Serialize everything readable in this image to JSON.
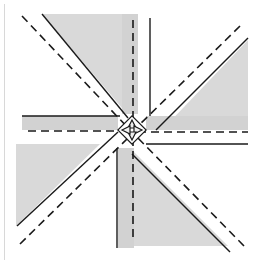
{
  "diagram": {
    "title": "",
    "colors": {
      "background": "#ffffff",
      "shade": "#d9d9d9",
      "shade_dark": "#c4c4c4",
      "line": "#1a1a1a",
      "frame": "#d0d0d0"
    },
    "elements": [
      {
        "id": "flap-top",
        "type": "shaded-triangle"
      },
      {
        "id": "flap-right",
        "type": "shaded-triangle"
      },
      {
        "id": "flap-bottom",
        "type": "shaded-triangle"
      },
      {
        "id": "flap-left",
        "type": "shaded-triangle"
      },
      {
        "id": "dashed-diagonal-nw",
        "type": "valley-fold-line"
      },
      {
        "id": "dashed-diagonal-ne",
        "type": "valley-fold-line"
      },
      {
        "id": "dashed-diagonal-sw",
        "type": "valley-fold-line"
      },
      {
        "id": "dashed-diagonal-se",
        "type": "valley-fold-line"
      },
      {
        "id": "dashed-horizontal",
        "type": "valley-fold-line"
      },
      {
        "id": "dashed-vertical",
        "type": "valley-fold-line"
      },
      {
        "id": "center-point",
        "type": "folded-center"
      }
    ]
  }
}
